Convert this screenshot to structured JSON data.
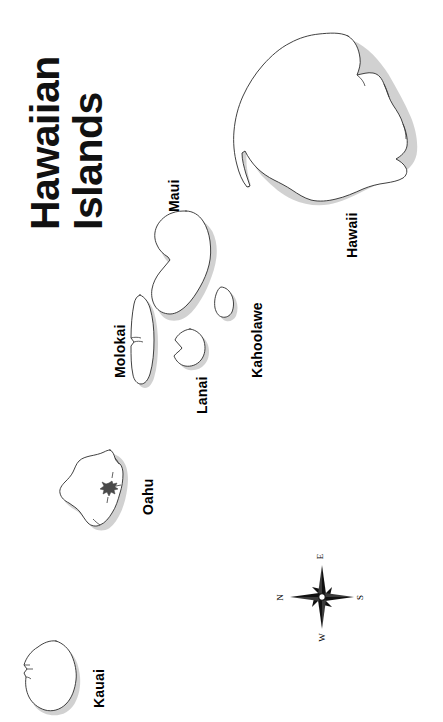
{
  "map": {
    "title_lines": [
      "Hawaiian",
      "Islands"
    ],
    "orientation_note": "rotated-90-ccw",
    "background_color": "#ffffff",
    "outline_color": "#2b2b2b",
    "label_color": "#000000",
    "islands": [
      {
        "name": "Hawaii",
        "label": "Hawaii"
      },
      {
        "name": "Maui",
        "label": "Maui"
      },
      {
        "name": "Kahoolawe",
        "label": "Kahoolawe"
      },
      {
        "name": "Lanai",
        "label": "Lanai"
      },
      {
        "name": "Molokai",
        "label": "Molokai"
      },
      {
        "name": "Oahu",
        "label": "Oahu"
      },
      {
        "name": "Kauai",
        "label": "Kauai"
      }
    ],
    "compass": {
      "name": "compass-rose",
      "north": "N",
      "east": "E",
      "south": "S",
      "west": "W"
    }
  }
}
